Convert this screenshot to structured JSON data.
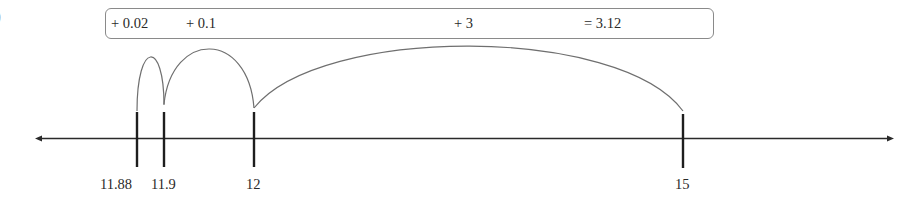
{
  "edge_glyph": ")",
  "summary": {
    "terms": [
      {
        "label": "+ 0.02",
        "x": 111
      },
      {
        "label": "+ 0.1",
        "x": 186
      },
      {
        "label": "+ 3",
        "x": 454
      },
      {
        "label": "= 3.12",
        "x": 584
      }
    ]
  },
  "number_line": {
    "ticks": [
      {
        "value": 11.88,
        "label": "11.88",
        "x": 137
      },
      {
        "value": 11.9,
        "label": "11.9",
        "x": 164
      },
      {
        "value": 12,
        "label": "12",
        "x": 254
      },
      {
        "value": 15,
        "label": "15",
        "x": 683
      }
    ],
    "jumps": [
      {
        "from": 11.88,
        "to": 11.9,
        "amount": "+ 0.02"
      },
      {
        "from": 11.9,
        "to": 12,
        "amount": "+ 0.1"
      },
      {
        "from": 12,
        "to": 15,
        "amount": "+ 3"
      }
    ],
    "total": "= 3.12",
    "line_color": "#2a2a2a",
    "arc_color": "#6f6f6f"
  }
}
